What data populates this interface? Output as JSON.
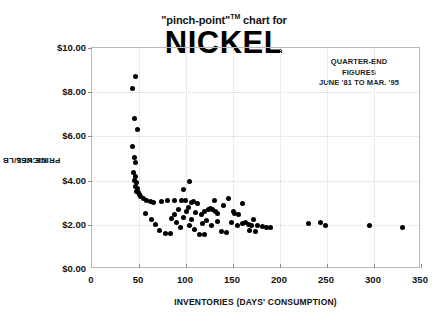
{
  "title": {
    "line1_prefix": "\"pinch-point\"",
    "line1_tm": "TM",
    "line1_suffix": " chart for",
    "line2": "NICKEL"
  },
  "annotation": {
    "line1": "QUARTER-END",
    "line2": "FIGURES",
    "line3": "JUNE '81 TO MAR. '95"
  },
  "axis": {
    "y_title_line1": "NICKEL",
    "y_title_line2": "PRICE US$/LB",
    "x_title": "INVENTORIES (DAYS' CONSUMPTION)"
  },
  "colors": {
    "point": "#000000",
    "frame": "#b9b9b9",
    "grid": "#d8d8d8",
    "background": "#ffffff",
    "text": "#111111"
  },
  "chart_data": {
    "type": "scatter",
    "title": "\"pinch-point\"TM chart for NICKEL",
    "subtitle": "QUARTER-END FIGURES JUNE '81 TO MAR. '95",
    "xlabel": "INVENTORIES (DAYS' CONSUMPTION)",
    "ylabel": "NICKEL PRICE US$/LB",
    "xlim": [
      0,
      350
    ],
    "ylim": [
      0,
      10
    ],
    "xticks": [
      0,
      50,
      100,
      150,
      200,
      250,
      300,
      350
    ],
    "xtick_labels": [
      "0",
      "50",
      "100",
      "150",
      "200",
      "250",
      "300",
      "350"
    ],
    "yticks": [
      0,
      2,
      4,
      6,
      8,
      10
    ],
    "ytick_labels": [
      "$0.00",
      "$2.00",
      "$4.00",
      "$6.00",
      "$8.00",
      "$10.00"
    ],
    "grid": true,
    "grid_style": "dotted",
    "legend": false,
    "marker": "circle",
    "marker_color": "#000000",
    "marker_size": 5,
    "points": [
      [
        46,
        8.72
      ],
      [
        43,
        8.17
      ],
      [
        45,
        6.82
      ],
      [
        48,
        6.3
      ],
      [
        43,
        5.55
      ],
      [
        45,
        5.05
      ],
      [
        46,
        4.82
      ],
      [
        44,
        4.35
      ],
      [
        46,
        4.2
      ],
      [
        45,
        4.02
      ],
      [
        47,
        3.92
      ],
      [
        46,
        3.72
      ],
      [
        48,
        3.62
      ],
      [
        47,
        3.5
      ],
      [
        49,
        3.44
      ],
      [
        50,
        3.35
      ],
      [
        52,
        3.3
      ],
      [
        55,
        3.18
      ],
      [
        58,
        3.1
      ],
      [
        62,
        3.05
      ],
      [
        65,
        3.0
      ],
      [
        57,
        2.52
      ],
      [
        63,
        2.22
      ],
      [
        68,
        2.0
      ],
      [
        72,
        1.75
      ],
      [
        78,
        1.6
      ],
      [
        74,
        3.05
      ],
      [
        80,
        3.1
      ],
      [
        88,
        3.12
      ],
      [
        95,
        3.08
      ],
      [
        97,
        3.6
      ],
      [
        104,
        3.95
      ],
      [
        99,
        3.1
      ],
      [
        92,
        2.7
      ],
      [
        88,
        2.45
      ],
      [
        85,
        2.3
      ],
      [
        90,
        2.1
      ],
      [
        94,
        1.9
      ],
      [
        97,
        2.32
      ],
      [
        101,
        2.6
      ],
      [
        103,
        2.8
      ],
      [
        106,
        3.0
      ],
      [
        108,
        3.05
      ],
      [
        112,
        2.95
      ],
      [
        110,
        2.55
      ],
      [
        106,
        2.25
      ],
      [
        104,
        1.98
      ],
      [
        109,
        1.8
      ],
      [
        116,
        2.45
      ],
      [
        120,
        2.62
      ],
      [
        124,
        2.7
      ],
      [
        126,
        2.75
      ],
      [
        128,
        2.68
      ],
      [
        131,
        2.6
      ],
      [
        133,
        2.52
      ],
      [
        122,
        2.2
      ],
      [
        118,
        2.05
      ],
      [
        127,
        1.95
      ],
      [
        134,
        2.15
      ],
      [
        140,
        2.88
      ],
      [
        145,
        3.2
      ],
      [
        150,
        2.6
      ],
      [
        152,
        2.5
      ],
      [
        156,
        2.45
      ],
      [
        148,
        2.1
      ],
      [
        155,
        1.95
      ],
      [
        160,
        2.05
      ],
      [
        163,
        2.1
      ],
      [
        166,
        2.0
      ],
      [
        170,
        1.95
      ],
      [
        172,
        2.25
      ],
      [
        176,
        1.98
      ],
      [
        181,
        1.92
      ],
      [
        186,
        1.9
      ],
      [
        190,
        1.88
      ],
      [
        168,
        1.72
      ],
      [
        174,
        1.7
      ],
      [
        138,
        1.7
      ],
      [
        143,
        1.65
      ],
      [
        114,
        1.58
      ],
      [
        120,
        1.55
      ],
      [
        83,
        1.62
      ],
      [
        130,
        3.1
      ],
      [
        160,
        2.95
      ],
      [
        230,
        2.05
      ],
      [
        243,
        2.1
      ],
      [
        248,
        1.98
      ],
      [
        295,
        1.95
      ],
      [
        330,
        1.9
      ]
    ]
  }
}
